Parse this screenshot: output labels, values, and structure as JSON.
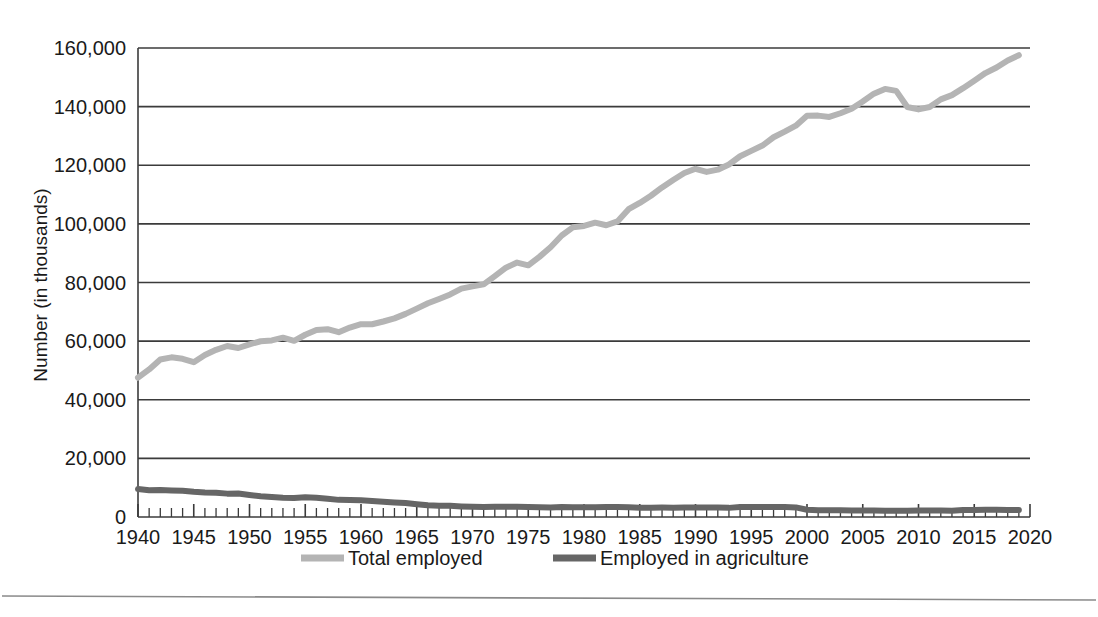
{
  "chart_data": {
    "type": "line",
    "title": "",
    "xlabel": "",
    "ylabel": "Number (in thousands)",
    "xlim": [
      1940,
      2020
    ],
    "ylim": [
      0,
      160000
    ],
    "xticks": [
      1940,
      1945,
      1950,
      1955,
      1960,
      1965,
      1970,
      1975,
      1980,
      1985,
      1990,
      1995,
      2000,
      2005,
      2010,
      2015,
      2020
    ],
    "xtick_labels": [
      "1940",
      "1945",
      "1950",
      "1955",
      "1960",
      "1965",
      "1970",
      "1975",
      "1980",
      "1985",
      "1990",
      "1995",
      "2000",
      "2005",
      "2010",
      "2015",
      "2020"
    ],
    "yticks": [
      0,
      20000,
      40000,
      60000,
      80000,
      100000,
      120000,
      140000,
      160000
    ],
    "ytick_labels": [
      "0",
      "20,000",
      "40,000",
      "60,000",
      "80,000",
      "100,000",
      "120,000",
      "140,000",
      "160,000"
    ],
    "minor_xtick_interval": 1,
    "grid": "horizontal",
    "legend_position": "bottom",
    "x": [
      1940,
      1941,
      1942,
      1943,
      1944,
      1945,
      1946,
      1947,
      1948,
      1949,
      1950,
      1951,
      1952,
      1953,
      1954,
      1955,
      1956,
      1957,
      1958,
      1959,
      1960,
      1961,
      1962,
      1963,
      1964,
      1965,
      1966,
      1967,
      1968,
      1969,
      1970,
      1971,
      1972,
      1973,
      1974,
      1975,
      1976,
      1977,
      1978,
      1979,
      1980,
      1981,
      1982,
      1983,
      1984,
      1985,
      1986,
      1987,
      1988,
      1989,
      1990,
      1991,
      1992,
      1993,
      1994,
      1995,
      1996,
      1997,
      1998,
      1999,
      2000,
      2001,
      2002,
      2003,
      2004,
      2005,
      2006,
      2007,
      2008,
      2009,
      2010,
      2011,
      2012,
      2013,
      2014,
      2015,
      2016,
      2017,
      2018,
      2019
    ],
    "series": [
      {
        "name": "Total employed",
        "color": "#b4b4b4",
        "line_width": 6,
        "values": [
          47520,
          50350,
          53750,
          54470,
          53960,
          52820,
          55250,
          57040,
          58340,
          57650,
          58920,
          59960,
          60250,
          61180,
          60110,
          62170,
          63800,
          64070,
          63040,
          64630,
          65780,
          65750,
          66700,
          67760,
          69300,
          71090,
          72900,
          74370,
          75920,
          77900,
          78680,
          79370,
          82150,
          85060,
          86790,
          85850,
          88750,
          92020,
          96050,
          98820,
          99300,
          100400,
          99530,
          100830,
          105000,
          107150,
          109600,
          112440,
          114970,
          117340,
          118790,
          117720,
          118490,
          120260,
          123060,
          124900,
          126710,
          129560,
          131460,
          133490,
          136890,
          136930,
          136490,
          137740,
          139250,
          141730,
          144430,
          146050,
          145360,
          139880,
          139060,
          139870,
          142470,
          143930,
          146310,
          148830,
          151440,
          153340,
          155760,
          157540
        ]
      },
      {
        "name": "Employed in agriculture",
        "color": "#666666",
        "line_width": 6,
        "values": [
          9540,
          9100,
          9250,
          9080,
          8950,
          8580,
          8320,
          8266,
          7973,
          8026,
          7497,
          7048,
          6792,
          6555,
          6495,
          6718,
          6572,
          6222,
          5844,
          5836,
          5723,
          5463,
          5190,
          4946,
          4761,
          4361,
          3979,
          3844,
          3817,
          3606,
          3463,
          3394,
          3484,
          3470,
          3515,
          3408,
          3331,
          3283,
          3387,
          3347,
          3364,
          3368,
          3401,
          3383,
          3321,
          3179,
          3163,
          3208,
          3169,
          3199,
          3223,
          3269,
          3247,
          3115,
          3409,
          3440,
          3443,
          3399,
          3378,
          3281,
          2464,
          2299,
          2311,
          2275,
          2232,
          2197,
          2206,
          2095,
          2168,
          2103,
          2206,
          2254,
          2186,
          2130,
          2422,
          2422,
          2460,
          2454,
          2425,
          2402
        ]
      }
    ]
  },
  "legend": {
    "items": [
      {
        "label": "Total employed",
        "color": "#b4b4b4"
      },
      {
        "label": "Employed in agriculture",
        "color": "#666666"
      }
    ]
  },
  "axes": {
    "y_title": "Number (in thousands)"
  }
}
